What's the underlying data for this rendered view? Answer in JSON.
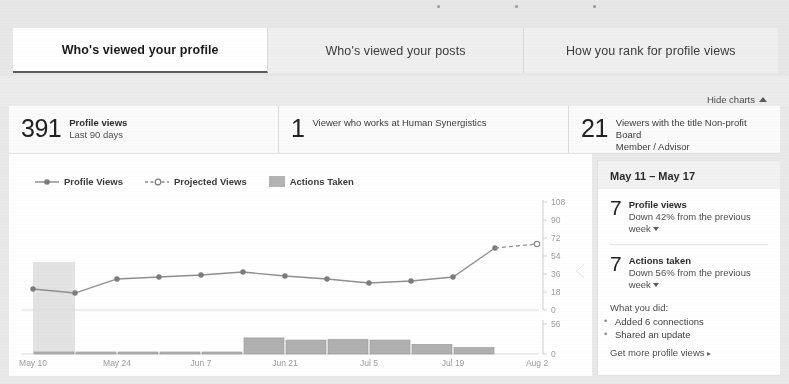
{
  "tabs": [
    {
      "label": "Who's viewed your profile",
      "active": true
    },
    {
      "label": "Who's viewed your posts",
      "active": false
    },
    {
      "label": "How you rank for profile views",
      "active": false
    }
  ],
  "toolbar": {
    "hide_charts_label": "Hide charts",
    "hide_charts_icon": "chevron-up-icon"
  },
  "stats": [
    {
      "number": "391",
      "title": "Profile views",
      "sub": "Last 90 days",
      "bold_title": true
    },
    {
      "number": "1",
      "title": "Viewer who works at Human Synergistics",
      "sub": "",
      "bold_title": false
    },
    {
      "number": "21",
      "title": "Viewers with the title Non-profit Board",
      "sub": "Member / Advisor",
      "bold_title": false
    }
  ],
  "legend": [
    {
      "label": "Profile Views",
      "marker": "solid-line-dot",
      "color": "#8a8a8a"
    },
    {
      "label": "Projected Views",
      "marker": "dashed-line-circle",
      "color": "#8a8a8a"
    },
    {
      "label": "Actions Taken",
      "marker": "square-swatch",
      "color": "#b3b3b3"
    }
  ],
  "sidebar": {
    "date_range": "May 11 – May 17",
    "blocks": [
      {
        "number": "7",
        "title": "Profile views",
        "sub": "Down 42% from the previous week",
        "caret": "caret-down-icon"
      },
      {
        "number": "7",
        "title": "Actions taken",
        "sub": "Down 56% from the previous week",
        "caret": "caret-down-icon"
      }
    ],
    "what_you_did_label": "What you did:",
    "what_you_did": [
      "Added 6 connections",
      "Shared an update"
    ],
    "cta_label": "Get more profile views",
    "cta_icon": "arrow-right-icon"
  },
  "chart_data": {
    "type": "line",
    "title": "",
    "xlabel": "",
    "ylabel": "",
    "grid": true,
    "legend_position": "top-left",
    "x_tick_labels": [
      "May 10",
      "May 24",
      "Jun 7",
      "Jun 21",
      "Jul 5",
      "Jul 19",
      "Aug 2"
    ],
    "x_tick_positions": [
      0,
      2,
      4,
      6,
      8,
      10,
      12
    ],
    "line_panel": {
      "ylim": [
        0,
        108
      ],
      "y_ticks": [
        0,
        18,
        36,
        54,
        72,
        90,
        108
      ],
      "y_tick_labels": [
        "0",
        "18",
        "36",
        "54",
        "72",
        "90",
        "108"
      ],
      "series": [
        {
          "name": "Profile Views",
          "style": "solid",
          "x": [
            0,
            1,
            2,
            3,
            4,
            5,
            6,
            7,
            8,
            9,
            10,
            11
          ],
          "values": [
            21,
            17,
            31,
            33,
            35,
            38,
            34,
            31,
            27,
            29,
            33,
            62
          ]
        },
        {
          "name": "Projected Views",
          "style": "dashed",
          "x": [
            11,
            12
          ],
          "values": [
            62,
            66
          ]
        }
      ]
    },
    "bar_panel": {
      "ylim": [
        0,
        56
      ],
      "y_ticks": [
        0,
        56
      ],
      "y_tick_labels": [
        "0",
        "56"
      ],
      "series": [
        {
          "name": "Actions Taken",
          "categories": [
            "May 10",
            "May 17",
            "May 24",
            "May 31",
            "Jun 7",
            "Jun 14",
            "Jun 21",
            "Jun 28",
            "Jul 5",
            "Jul 12",
            "Jul 19",
            "Jul 26"
          ],
          "values": [
            2,
            3,
            1,
            1,
            2,
            30,
            26,
            27,
            26,
            18,
            12,
            0
          ]
        }
      ]
    },
    "highlight_band": {
      "from_x": 0,
      "to_x": 1,
      "label": "May 11 – May 17"
    }
  }
}
